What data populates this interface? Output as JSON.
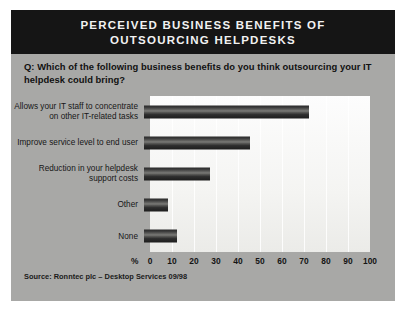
{
  "header": {
    "title_line_1": "PERCEIVED BUSINESS BENEFITS OF",
    "title_line_2": "OUTSOURCING HELPDESKS",
    "banner_color": "#151515",
    "text_color": "#f2f2f2"
  },
  "question": {
    "text": "Q: Which of the following business benefits do you think outsourcing your IT helpdesk could bring?"
  },
  "footer": {
    "source": "Source: Ronntec plc – Desktop Services 09/98"
  },
  "axis": {
    "unit_label": "%",
    "ticks": [
      "0",
      "10",
      "20",
      "30",
      "40",
      "50",
      "60",
      "70",
      "80",
      "90",
      "100"
    ]
  },
  "categories": [
    {
      "label": "Allows your IT staff to concentrate on other IT-related tasks"
    },
    {
      "label": "Improve service level to end user"
    },
    {
      "label": "Reduction in your helpdesk support costs"
    },
    {
      "label": "Other"
    },
    {
      "label": "None"
    }
  ],
  "chart_data": {
    "type": "bar",
    "orientation": "horizontal",
    "title": "PERCEIVED BUSINESS BENEFITS OF OUTSOURCING HELPDESKS",
    "subtitle": "Q: Which of the following business benefits do you think outsourcing your IT helpdesk could bring?",
    "categories": [
      "Allows your IT staff to concentrate on other IT-related tasks",
      "Improve service level to end user",
      "Reduction in your helpdesk support costs",
      "Other",
      "None"
    ],
    "values": [
      75,
      48,
      30,
      11,
      15
    ],
    "xlabel": "%",
    "ylabel": "",
    "xlim": [
      0,
      100
    ],
    "xticks": [
      0,
      10,
      20,
      30,
      40,
      50,
      60,
      70,
      80,
      90,
      100
    ],
    "grid": true,
    "legend": false,
    "bar_color": "#2a2a2a",
    "source": "Source: Ronntec plc – Desktop Services 09/98"
  }
}
